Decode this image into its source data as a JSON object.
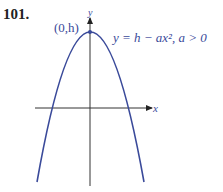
{
  "problem_number": "101.",
  "diagram": {
    "vertex_label": "(0,h)",
    "equation_label": "y = h − ax², a > 0",
    "x_axis_label": "x",
    "y_axis_label": "y",
    "curve_color": "#3a4a9a",
    "axis_color": "#333333"
  }
}
